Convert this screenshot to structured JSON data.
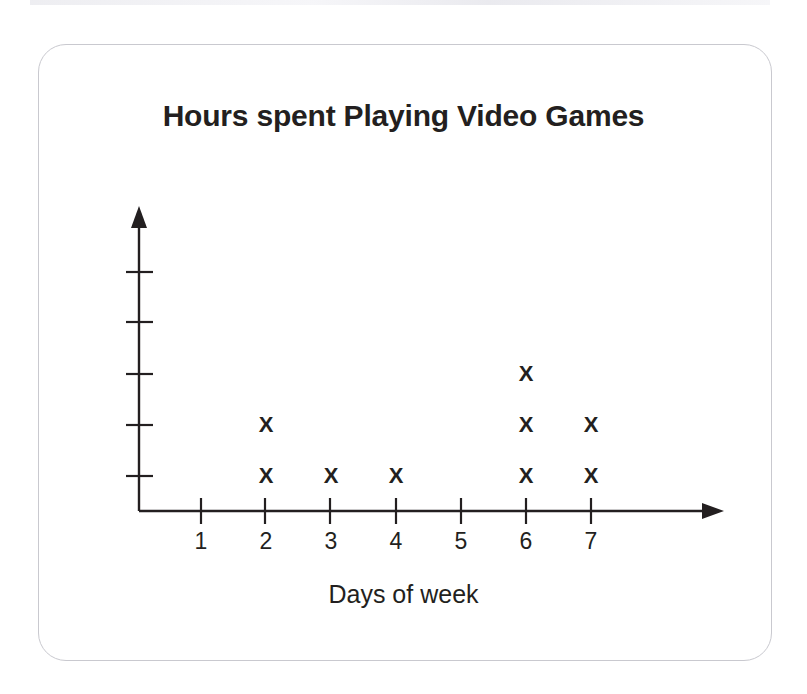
{
  "chart_data": {
    "type": "scatter",
    "title": "Hours spent Playing Video Games",
    "xlabel": "Days of week",
    "ylabel": "Number of hours",
    "marker": "X",
    "grid": false,
    "legend": null,
    "x_tick_labels": [
      "1",
      "2",
      "3",
      "4",
      "5",
      "6",
      "7"
    ],
    "y_tick_labels": [
      "",
      "",
      "",
      "",
      ""
    ],
    "categories": [
      1,
      2,
      3,
      4,
      5,
      6,
      7
    ],
    "values": [
      0,
      2,
      1,
      1,
      0,
      3,
      2
    ],
    "xlim": [
      0,
      7.5
    ],
    "ylim": [
      0,
      5
    ],
    "points": [
      {
        "x": 2,
        "y": 1
      },
      {
        "x": 2,
        "y": 2
      },
      {
        "x": 3,
        "y": 1
      },
      {
        "x": 4,
        "y": 1
      },
      {
        "x": 6,
        "y": 1
      },
      {
        "x": 6,
        "y": 2
      },
      {
        "x": 6,
        "y": 3
      },
      {
        "x": 7,
        "y": 1
      },
      {
        "x": 7,
        "y": 2
      }
    ],
    "axis_color": "#231f20",
    "marker_color": "#231f20",
    "frame_color": "#c9c9cf"
  }
}
